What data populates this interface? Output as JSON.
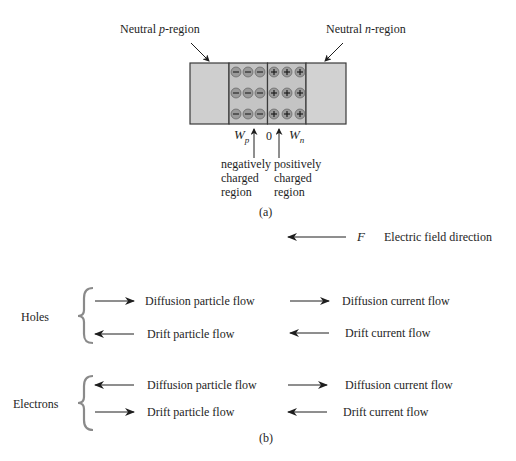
{
  "figure_a": {
    "label_p_region_prefix": "Neutral ",
    "label_p_region_italic": "p",
    "label_p_region_suffix": "-region",
    "label_n_region_prefix": "Neutral ",
    "label_n_region_italic": "n",
    "label_n_region_suffix": "-region",
    "wp_symbol": "W",
    "wp_subscript": "p",
    "origin_label": "0",
    "wn_symbol": "W",
    "wn_subscript": "n",
    "negative_region_lines": [
      "negatively",
      "charged",
      "region"
    ],
    "positive_region_lines": [
      "positively",
      "charged",
      "region"
    ],
    "negative_charge_glyph": "−",
    "positive_charge_glyph": "+",
    "charge_rows": 3,
    "charges_per_side_per_row": 3,
    "caption": "(a)",
    "colors": {
      "neutral_fill": "#cfcfcf",
      "depletion_fill": "#c4c4c4",
      "outline": "#3a3a3a",
      "ion_fill": "#9a9a9a"
    }
  },
  "field": {
    "symbol": "F",
    "label": "Electric field direction",
    "arrow_direction": "left"
  },
  "figure_b": {
    "caption": "(b)",
    "brace_color": "#8a8a8a",
    "groups": [
      {
        "name": "Holes",
        "rows": [
          {
            "particle_label": "Diffusion particle flow",
            "particle_dir": "right",
            "current_label": "Diffusion current flow",
            "current_dir": "right"
          },
          {
            "particle_label": "Drift particle flow",
            "particle_dir": "left",
            "current_label": "Drift current flow",
            "current_dir": "left"
          }
        ]
      },
      {
        "name": "Electrons",
        "rows": [
          {
            "particle_label": "Diffusion particle flow",
            "particle_dir": "left",
            "current_label": "Diffusion current flow",
            "current_dir": "right"
          },
          {
            "particle_label": "Drift particle flow",
            "particle_dir": "right",
            "current_label": "Drift current flow",
            "current_dir": "left"
          }
        ]
      }
    ]
  }
}
